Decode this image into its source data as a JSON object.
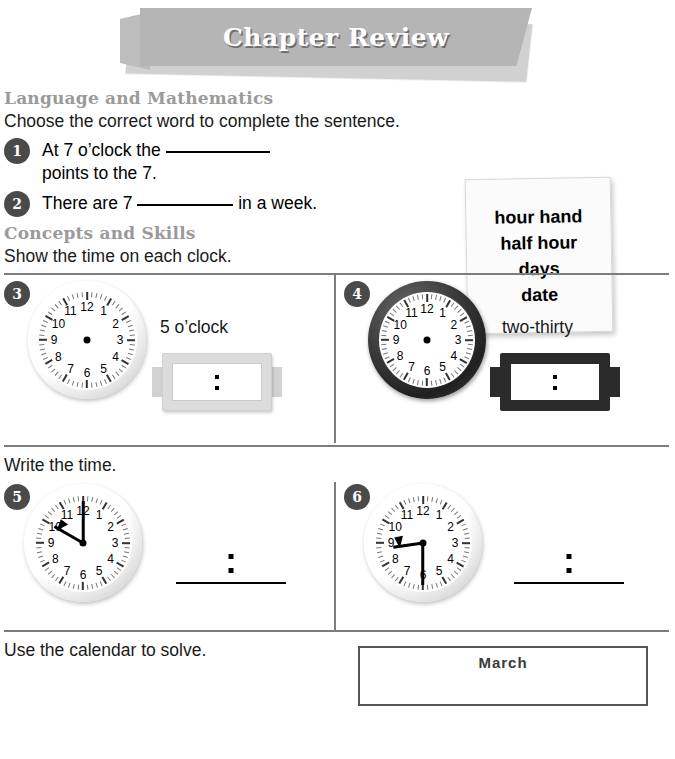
{
  "banner": {
    "title": "Chapter Review"
  },
  "section1": {
    "heading": "Language and Mathematics",
    "instruction": "Choose the correct word to complete the sentence.",
    "items": [
      {
        "number": "1",
        "text_before": "At 7 o’clock the",
        "text_after": "points to the 7."
      },
      {
        "number": "2",
        "text_before": "There are 7",
        "text_after": "in a week."
      }
    ],
    "word_box": [
      "hour hand",
      "half hour",
      "days",
      "date"
    ]
  },
  "section2": {
    "heading": "Concepts and Skills",
    "instruction": "Show the time on each clock.",
    "items": [
      {
        "number": "3",
        "time_label": "5 o’clock",
        "clock_style": "light",
        "clock_hands": "none",
        "digital_style": "light",
        "digital_value": ":"
      },
      {
        "number": "4",
        "time_label": "two-thirty",
        "clock_style": "dark",
        "clock_hands": "none",
        "digital_style": "dark",
        "digital_value": ":"
      }
    ]
  },
  "section3": {
    "instruction": "Write the time.",
    "items": [
      {
        "number": "5",
        "clock_style": "light",
        "clock_hands": "10:00",
        "hour_angle": 300,
        "minute_angle": 0,
        "answer": ":"
      },
      {
        "number": "6",
        "clock_style": "light",
        "clock_hands": "8:30",
        "hour_angle": 255,
        "minute_angle": 180,
        "answer": ":"
      }
    ]
  },
  "section4": {
    "instruction": "Use the calendar to solve.",
    "calendar_title": "March"
  },
  "clock_numbers": [
    "12",
    "1",
    "2",
    "3",
    "4",
    "5",
    "6",
    "7",
    "8",
    "9",
    "10",
    "11"
  ],
  "colors": {
    "banner_bg": "#b5b5b5",
    "heading_gray": "#9a9a9a",
    "badge_bg": "#4a4a4a",
    "divider": "#7d7d7d",
    "digital_dark": "#2b2b2b",
    "digital_light": "#dcdcdc"
  }
}
